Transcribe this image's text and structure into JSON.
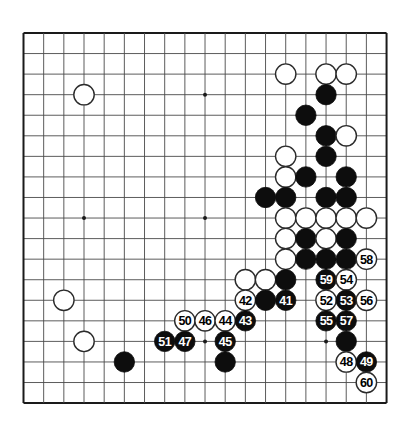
{
  "diagram": {
    "type": "go-board-diagram",
    "title": "",
    "board_size": 19,
    "colors": {
      "background": "#ffffff",
      "grid_line": "#4a4a4a",
      "border_line": "#1a1a1a",
      "black_stone": "#0d0d0d",
      "white_stone_fill": "#ffffff",
      "white_stone_edge": "#2b2b2b",
      "star_point": "#1a1a1a",
      "label_on_black": "#ffffff",
      "label_on_white": "#000000"
    },
    "geometry": {
      "origin_x": 23.5,
      "origin_y": 33.0,
      "spacing_x": 20.17,
      "spacing_y": 20.56,
      "stone_radius": 10.2,
      "star_radius": 2.0
    },
    "star_points": [
      {
        "col": 3,
        "row": 3
      },
      {
        "col": 9,
        "row": 3
      },
      {
        "col": 15,
        "row": 3
      },
      {
        "col": 3,
        "row": 9
      },
      {
        "col": 9,
        "row": 9
      },
      {
        "col": 15,
        "row": 9
      },
      {
        "col": 3,
        "row": 15
      },
      {
        "col": 9,
        "row": 15
      },
      {
        "col": 15,
        "row": 15
      }
    ],
    "stones": [
      {
        "col": 3,
        "row": 3,
        "color": "white",
        "label": ""
      },
      {
        "col": 13,
        "row": 2,
        "color": "white",
        "label": ""
      },
      {
        "col": 15,
        "row": 2,
        "color": "white",
        "label": ""
      },
      {
        "col": 16,
        "row": 2,
        "color": "white",
        "label": ""
      },
      {
        "col": 15,
        "row": 3,
        "color": "black",
        "label": ""
      },
      {
        "col": 14,
        "row": 4,
        "color": "black",
        "label": ""
      },
      {
        "col": 15,
        "row": 5,
        "color": "black",
        "label": ""
      },
      {
        "col": 16,
        "row": 5,
        "color": "white",
        "label": ""
      },
      {
        "col": 15,
        "row": 6,
        "color": "black",
        "label": ""
      },
      {
        "col": 13,
        "row": 6,
        "color": "white",
        "label": ""
      },
      {
        "col": 13,
        "row": 7,
        "color": "white",
        "label": ""
      },
      {
        "col": 14,
        "row": 7,
        "color": "black",
        "label": ""
      },
      {
        "col": 16,
        "row": 7,
        "color": "black",
        "label": ""
      },
      {
        "col": 12,
        "row": 8,
        "color": "black",
        "label": ""
      },
      {
        "col": 13,
        "row": 8,
        "color": "black",
        "label": ""
      },
      {
        "col": 15,
        "row": 8,
        "color": "black",
        "label": ""
      },
      {
        "col": 16,
        "row": 8,
        "color": "black",
        "label": ""
      },
      {
        "col": 13,
        "row": 9,
        "color": "white",
        "label": ""
      },
      {
        "col": 14,
        "row": 9,
        "color": "white",
        "label": ""
      },
      {
        "col": 15,
        "row": 9,
        "color": "white",
        "label": ""
      },
      {
        "col": 16,
        "row": 9,
        "color": "white",
        "label": ""
      },
      {
        "col": 17,
        "row": 9,
        "color": "white",
        "label": ""
      },
      {
        "col": 13,
        "row": 10,
        "color": "white",
        "label": ""
      },
      {
        "col": 14,
        "row": 10,
        "color": "black",
        "label": ""
      },
      {
        "col": 15,
        "row": 10,
        "color": "white",
        "label": ""
      },
      {
        "col": 16,
        "row": 10,
        "color": "black",
        "label": ""
      },
      {
        "col": 13,
        "row": 11,
        "color": "white",
        "label": ""
      },
      {
        "col": 14,
        "row": 11,
        "color": "black",
        "label": ""
      },
      {
        "col": 15,
        "row": 11,
        "color": "black",
        "label": ""
      },
      {
        "col": 16,
        "row": 11,
        "color": "black",
        "label": ""
      },
      {
        "col": 17,
        "row": 11,
        "color": "white",
        "label": "58"
      },
      {
        "col": 11,
        "row": 12,
        "color": "white",
        "label": ""
      },
      {
        "col": 12,
        "row": 12,
        "color": "white",
        "label": ""
      },
      {
        "col": 13,
        "row": 12,
        "color": "black",
        "label": ""
      },
      {
        "col": 15,
        "row": 12,
        "color": "black",
        "label": "59"
      },
      {
        "col": 16,
        "row": 12,
        "color": "white",
        "label": "54"
      },
      {
        "col": 11,
        "row": 13,
        "color": "white",
        "label": "42"
      },
      {
        "col": 12,
        "row": 13,
        "color": "black",
        "label": ""
      },
      {
        "col": 13,
        "row": 13,
        "color": "black",
        "label": "41"
      },
      {
        "col": 15,
        "row": 13,
        "color": "white",
        "label": "52"
      },
      {
        "col": 16,
        "row": 13,
        "color": "black",
        "label": "53"
      },
      {
        "col": 17,
        "row": 13,
        "color": "white",
        "label": "56"
      },
      {
        "col": 8,
        "row": 14,
        "color": "white",
        "label": "50"
      },
      {
        "col": 9,
        "row": 14,
        "color": "white",
        "label": "46"
      },
      {
        "col": 10,
        "row": 14,
        "color": "white",
        "label": "44"
      },
      {
        "col": 11,
        "row": 14,
        "color": "black",
        "label": "43"
      },
      {
        "col": 15,
        "row": 14,
        "color": "black",
        "label": "55"
      },
      {
        "col": 16,
        "row": 14,
        "color": "black",
        "label": "57"
      },
      {
        "col": 2,
        "row": 13,
        "color": "white",
        "label": ""
      },
      {
        "col": 3,
        "row": 15,
        "color": "white",
        "label": ""
      },
      {
        "col": 7,
        "row": 15,
        "color": "black",
        "label": "51"
      },
      {
        "col": 8,
        "row": 15,
        "color": "black",
        "label": "47"
      },
      {
        "col": 10,
        "row": 15,
        "color": "black",
        "label": "45"
      },
      {
        "col": 16,
        "row": 15,
        "color": "black",
        "label": ""
      },
      {
        "col": 5,
        "row": 16,
        "color": "black",
        "label": ""
      },
      {
        "col": 10,
        "row": 16,
        "color": "black",
        "label": ""
      },
      {
        "col": 16,
        "row": 16,
        "color": "white",
        "label": "48"
      },
      {
        "col": 17,
        "row": 16,
        "color": "black",
        "label": "49"
      },
      {
        "col": 17,
        "row": 17,
        "color": "white",
        "label": "60"
      }
    ]
  }
}
